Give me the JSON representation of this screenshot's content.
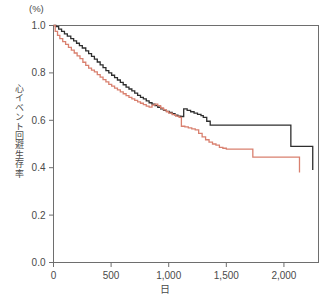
{
  "chart_data": {
    "type": "line",
    "title": "",
    "subtitle": "",
    "xlabel": "日",
    "ylabel": "心イベント回避生存率",
    "y_unit_label": "(%)",
    "xlim": [
      0,
      2300
    ],
    "ylim": [
      0.0,
      1.0
    ],
    "xticks": [
      0,
      500,
      1000,
      1500,
      2000
    ],
    "xticklabels": [
      "0",
      "500",
      "1,000",
      "1,500",
      "2,000"
    ],
    "yticks": [
      0.0,
      0.2,
      0.4,
      0.6,
      0.8,
      1.0
    ],
    "yticklabels": [
      "0.0",
      "0.2",
      "0.4",
      "0.6",
      "0.8",
      "1.0"
    ],
    "grid": false,
    "legend": "none",
    "step_style": "post",
    "series": [
      {
        "name": "black-curve",
        "color": "#2e2e2e",
        "x": [
          0,
          20,
          45,
          70,
          95,
          120,
          150,
          175,
          200,
          225,
          250,
          280,
          305,
          330,
          355,
          380,
          405,
          430,
          455,
          480,
          505,
          530,
          555,
          580,
          605,
          630,
          655,
          680,
          705,
          730,
          755,
          780,
          805,
          830,
          855,
          880,
          905,
          930,
          955,
          980,
          1005,
          1030,
          1055,
          1080,
          1105,
          1130,
          1160,
          1190,
          1220,
          1250,
          1280,
          1300,
          1330,
          1360,
          2040,
          2060,
          2240,
          2250
        ],
        "y": [
          1.0,
          0.995,
          0.985,
          0.975,
          0.965,
          0.955,
          0.945,
          0.935,
          0.925,
          0.915,
          0.905,
          0.893,
          0.881,
          0.87,
          0.858,
          0.846,
          0.834,
          0.822,
          0.81,
          0.8,
          0.79,
          0.78,
          0.77,
          0.76,
          0.75,
          0.74,
          0.732,
          0.724,
          0.715,
          0.705,
          0.697,
          0.69,
          0.682,
          0.674,
          0.668,
          0.662,
          0.655,
          0.648,
          0.642,
          0.638,
          0.633,
          0.628,
          0.622,
          0.618,
          0.616,
          0.648,
          0.642,
          0.636,
          0.63,
          0.625,
          0.62,
          0.612,
          0.596,
          0.58,
          0.58,
          0.49,
          0.49,
          0.39
        ]
      },
      {
        "name": "red-curve",
        "color": "#d9806f",
        "x": [
          0,
          15,
          35,
          55,
          80,
          105,
          130,
          155,
          180,
          205,
          230,
          255,
          280,
          305,
          330,
          355,
          380,
          405,
          430,
          455,
          480,
          505,
          530,
          555,
          580,
          605,
          630,
          655,
          680,
          705,
          730,
          755,
          780,
          805,
          830,
          855,
          880,
          905,
          930,
          955,
          980,
          1000,
          1030,
          1060,
          1090,
          1110,
          1140,
          1170,
          1200,
          1230,
          1260,
          1290,
          1320,
          1350,
          1380,
          1410,
          1440,
          1470,
          1500,
          1530,
          1560,
          1590,
          1620,
          1660,
          1700,
          1730,
          2110,
          2130,
          2135
        ],
        "y": [
          1.0,
          0.975,
          0.958,
          0.945,
          0.932,
          0.92,
          0.908,
          0.896,
          0.884,
          0.872,
          0.86,
          0.845,
          0.832,
          0.82,
          0.812,
          0.804,
          0.793,
          0.782,
          0.772,
          0.762,
          0.752,
          0.744,
          0.736,
          0.728,
          0.72,
          0.712,
          0.704,
          0.697,
          0.69,
          0.684,
          0.678,
          0.672,
          0.666,
          0.66,
          0.656,
          0.664,
          0.668,
          0.662,
          0.652,
          0.644,
          0.636,
          0.63,
          0.624,
          0.618,
          0.612,
          0.575,
          0.572,
          0.568,
          0.564,
          0.56,
          0.545,
          0.53,
          0.518,
          0.508,
          0.5,
          0.495,
          0.486,
          0.482,
          0.478,
          0.478,
          0.478,
          0.478,
          0.478,
          0.478,
          0.478,
          0.445,
          0.445,
          0.445,
          0.38
        ]
      }
    ]
  }
}
